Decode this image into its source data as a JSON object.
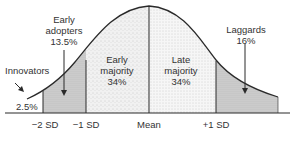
{
  "diagram": {
    "type": "bell-curve",
    "title": "",
    "segments": [
      {
        "name": "Innovators",
        "percent": "2.5%",
        "fill": "#ffffff"
      },
      {
        "name": "Early adopters",
        "percent": "13.5%",
        "fill": "#cfcfcf"
      },
      {
        "name": "Early majority",
        "percent": "34%",
        "fill": "#ececec"
      },
      {
        "name": "Late majority",
        "percent": "34%",
        "fill": "#f2f2f2"
      },
      {
        "name": "Laggards",
        "percent": "16%",
        "fill": "#c9c9c9"
      }
    ],
    "labels": {
      "innovators_name": "Innovators",
      "innovators_pct": "2.5%",
      "early_adopters_name1": "Early",
      "early_adopters_name2": "adopters",
      "early_adopters_pct": "13.5%",
      "early_majority_name1": "Early",
      "early_majority_name2": "majority",
      "early_majority_pct": "34%",
      "late_majority_name1": "Late",
      "late_majority_name2": "majority",
      "late_majority_pct": "34%",
      "laggards_name": "Laggards",
      "laggards_pct": "16%"
    },
    "axis_ticks": [
      "−2 SD",
      "−1 SD",
      "Mean",
      "+1 SD"
    ],
    "colors": {
      "line": "#2a2a2a",
      "text": "#333333"
    }
  }
}
